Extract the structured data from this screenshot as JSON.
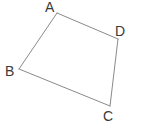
{
  "figure": {
    "kind": "geometry-figure",
    "shape_name": "quadrilateral ABCD",
    "canvas": {
      "width": 143,
      "height": 138,
      "background": "#ffffff"
    },
    "style": {
      "stroke_color": "#8a8a8a",
      "stroke_width": 1,
      "label_color": "#3a3a3a",
      "label_font_size": 14
    },
    "vertices": [
      {
        "id": "A",
        "label": "A",
        "x": 57,
        "y": 13,
        "label_x": 45,
        "label_y": 0
      },
      {
        "id": "B",
        "label": "B",
        "x": 19,
        "y": 69,
        "label_x": 5,
        "label_y": 64
      },
      {
        "id": "C",
        "label": "C",
        "x": 110,
        "y": 106,
        "label_x": 103,
        "label_y": 109
      },
      {
        "id": "D",
        "label": "D",
        "x": 118,
        "y": 39,
        "label_x": 115,
        "label_y": 24
      }
    ],
    "edges": [
      {
        "id": "AD",
        "from": "A",
        "to": "D",
        "x1": 57,
        "y1": 13,
        "x2": 118,
        "y2": 39
      },
      {
        "id": "DC",
        "from": "D",
        "to": "C",
        "x1": 118,
        "y1": 39,
        "x2": 110,
        "y2": 106
      },
      {
        "id": "CB",
        "from": "C",
        "to": "B",
        "x1": 110,
        "y1": 106,
        "x2": 19,
        "y2": 69
      },
      {
        "id": "BA",
        "from": "B",
        "to": "A",
        "x1": 19,
        "y1": 69,
        "x2": 57,
        "y2": 13
      }
    ]
  }
}
